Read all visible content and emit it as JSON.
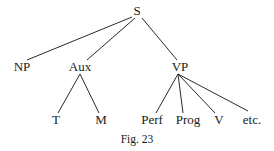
{
  "figure": {
    "caption": "Fig. 23",
    "type": "syntax-tree"
  },
  "nodes": {
    "s": {
      "label": "S",
      "x": 137,
      "y": 15
    },
    "np": {
      "label": "NP",
      "x": 22,
      "y": 71
    },
    "aux": {
      "label": "Aux",
      "x": 80,
      "y": 71
    },
    "vp": {
      "label": "VP",
      "x": 180,
      "y": 71
    },
    "t": {
      "label": "T",
      "x": 56,
      "y": 124
    },
    "m": {
      "label": "M",
      "x": 101,
      "y": 124
    },
    "perf": {
      "label": "Perf",
      "x": 152,
      "y": 124
    },
    "prog": {
      "label": "Prog",
      "x": 188,
      "y": 124
    },
    "v": {
      "label": "V",
      "x": 219,
      "y": 124
    },
    "etc": {
      "label": "etc.",
      "x": 252,
      "y": 124
    }
  },
  "edges": [
    {
      "from": "S",
      "to": "NP"
    },
    {
      "from": "S",
      "to": "Aux"
    },
    {
      "from": "S",
      "to": "VP"
    },
    {
      "from": "Aux",
      "to": "T"
    },
    {
      "from": "Aux",
      "to": "M"
    },
    {
      "from": "VP",
      "to": "Perf"
    },
    {
      "from": "VP",
      "to": "Prog"
    },
    {
      "from": "VP",
      "to": "V"
    },
    {
      "from": "VP",
      "to": "etc."
    }
  ]
}
